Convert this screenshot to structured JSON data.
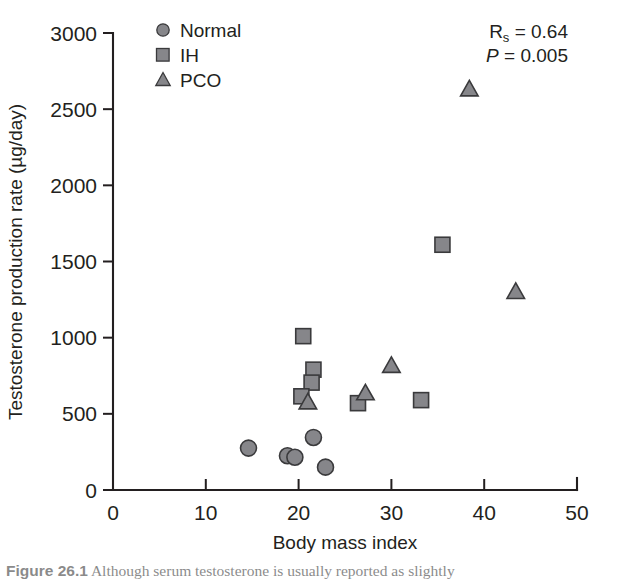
{
  "chart_data": {
    "type": "scatter",
    "title": "",
    "xlabel": "Body mass index",
    "ylabel": "Testosterone production rate (µg/day)",
    "xlim": [
      0,
      50
    ],
    "ylim": [
      0,
      3000
    ],
    "xticks": [
      "0",
      "10",
      "20",
      "30",
      "40",
      "50"
    ],
    "xtick_values": [
      0,
      10,
      20,
      30,
      40,
      50
    ],
    "yticks": [
      "0",
      "500",
      "1000",
      "1500",
      "2000",
      "2500",
      "3000"
    ],
    "ytick_values": [
      0,
      500,
      1000,
      1500,
      2000,
      2500,
      3000
    ],
    "grid": false,
    "legend_position": "top-left",
    "series": [
      {
        "name": "Normal",
        "marker": "circle",
        "color": "#86868a",
        "points": [
          {
            "x": 14.6,
            "y": 275
          },
          {
            "x": 18.8,
            "y": 225
          },
          {
            "x": 19.6,
            "y": 215
          },
          {
            "x": 21.6,
            "y": 345
          },
          {
            "x": 22.9,
            "y": 150
          }
        ]
      },
      {
        "name": "IH",
        "marker": "square",
        "color": "#86868a",
        "points": [
          {
            "x": 20.5,
            "y": 1010
          },
          {
            "x": 21.6,
            "y": 790
          },
          {
            "x": 21.4,
            "y": 705
          },
          {
            "x": 20.3,
            "y": 615
          },
          {
            "x": 26.4,
            "y": 570
          },
          {
            "x": 33.2,
            "y": 590
          },
          {
            "x": 35.5,
            "y": 1610
          }
        ]
      },
      {
        "name": "PCO",
        "marker": "triangle",
        "color": "#86868a",
        "points": [
          {
            "x": 21.0,
            "y": 575
          },
          {
            "x": 27.2,
            "y": 635
          },
          {
            "x": 30.0,
            "y": 815
          },
          {
            "x": 38.4,
            "y": 2630
          },
          {
            "x": 43.4,
            "y": 1300
          }
        ]
      }
    ],
    "annotations": [
      {
        "name": "spearman-r",
        "prefix": "R",
        "subscript": "s",
        "text": " = 0.64"
      },
      {
        "name": "p-value",
        "prefix": "P",
        "subscript": "",
        "text": " = 0.005"
      }
    ]
  },
  "legend": {
    "items": [
      {
        "label": "Normal",
        "marker": "circle"
      },
      {
        "label": "IH",
        "marker": "square"
      },
      {
        "label": "PCO",
        "marker": "triangle"
      }
    ]
  },
  "stats": {
    "r_symbol": "R",
    "r_subscript": "s",
    "r_value": " = 0.64",
    "p_symbol": "P",
    "p_value": " = 0.005"
  },
  "caption": {
    "figure_number": "Figure 26.1",
    "text": "Although serum testosterone is usually reported as slightly"
  }
}
